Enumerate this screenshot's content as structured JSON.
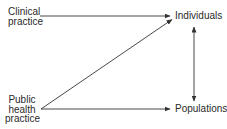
{
  "diagram": {
    "type": "flow",
    "nodes": {
      "clinical": {
        "lines": [
          "Clinical",
          "practice"
        ]
      },
      "public_health": {
        "lines": [
          "Public",
          "health",
          "practice"
        ]
      },
      "individuals": {
        "label": "Individuals"
      },
      "populations": {
        "label": "Populations"
      }
    },
    "edges": [
      {
        "from": "Clinical practice",
        "to": "Individuals",
        "style": "single-arrow"
      },
      {
        "from": "Public health practice",
        "to": "Individuals",
        "style": "single-arrow"
      },
      {
        "from": "Public health practice",
        "to": "Populations",
        "style": "single-arrow"
      },
      {
        "from": "Individuals",
        "to": "Populations",
        "style": "double-arrow"
      }
    ],
    "colors": {
      "line": "#333333",
      "text": "#2a2a2a",
      "background": "#ffffff"
    }
  }
}
